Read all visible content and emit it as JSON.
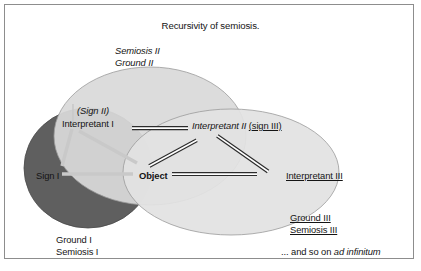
{
  "figure": {
    "title": "Recursivity of semiosis.",
    "width": 421,
    "height": 271,
    "border_color": "#8d8d8d",
    "background": "#ffffff"
  },
  "colors": {
    "ellipse_dark_fill": "#5f5f5f",
    "ellipse_light_fill": "#d9d9d9",
    "ellipse_lighter_fill": "#e2e2e2",
    "ellipse_outline": "#9a9a9a",
    "triangle_line": "#c9c9c9",
    "double_line_dark": "#2b2b2b",
    "text": "#141414"
  },
  "regions": [
    {
      "name": "semiosis-1",
      "label_lines": [
        "Ground I",
        "Semiosis I"
      ],
      "fill": "#5f5f5f",
      "italic": false,
      "underline": false
    },
    {
      "name": "semiosis-2",
      "label_lines": [
        "Semiosis II",
        "Ground II"
      ],
      "fill": "#d9d9d9",
      "italic": true,
      "underline": false
    },
    {
      "name": "semiosis-3",
      "label_lines": [
        "Ground III",
        "Semiosis III"
      ],
      "fill": "#e2e2e2",
      "italic": false,
      "underline": true
    }
  ],
  "nodes": {
    "sign_1": "Sign I",
    "sign_2": "(Sign II)",
    "interpretant_1": "Interpretant I",
    "interpretant_2_main": "Interpretant II",
    "interpretant_2_alias": "(sign III)",
    "object": "Object",
    "interpretant_3": "Interpretant III"
  },
  "labels": {
    "semiosis_2_line1": "Semiosis II",
    "semiosis_2_line2": "Ground II",
    "semiosis_1_line1": "Ground I",
    "semiosis_1_line2": "Semiosis I",
    "semiosis_3_line1": "Ground III",
    "semiosis_3_line2": "Semiosis III",
    "footer_plain": "... and so on ",
    "footer_italic": "ad infinitum"
  }
}
